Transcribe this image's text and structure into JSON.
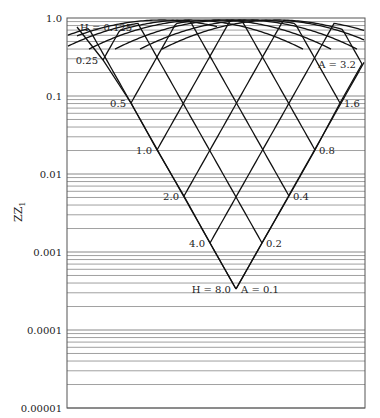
{
  "chart_data": {
    "type": "line",
    "title": "",
    "xlabel": "",
    "ylabel": "ZZ1",
    "yscale": "log",
    "ylim": [
      1e-05,
      1.0
    ],
    "yticks": [
      "1.0",
      "0.1",
      "0.01",
      "0.001",
      "0.0001",
      "0.00001"
    ],
    "grid": "horizontal log minor gridlines",
    "legend": "none",
    "H_series_labels": [
      "H = 0.125",
      "0.25",
      "0.5",
      "1.0",
      "2.0",
      "4.0",
      "H = 8.0"
    ],
    "A_series_labels": [
      "A = 3.2",
      "1.6",
      "0.8",
      "0.4",
      "0.2",
      "A = 0.1"
    ],
    "H_values": [
      0.125,
      0.25,
      0.5,
      1.0,
      2.0,
      4.0,
      8.0
    ],
    "A_values": [
      3.2,
      1.6,
      0.8,
      0.4,
      0.2,
      0.1
    ],
    "H_boundary_zz1": [
      0.6,
      0.25,
      0.075,
      0.02,
      0.0055,
      0.0015,
      0.0003
    ],
    "A_boundary_zz1": [
      0.3,
      0.075,
      0.02,
      0.0055,
      0.0015,
      0.0003
    ],
    "apex_zz1": 0.0003,
    "top_arc_zz1": 1.0
  },
  "axis": {
    "ylabel_main": "ZZ",
    "ylabel_sub": "1"
  }
}
